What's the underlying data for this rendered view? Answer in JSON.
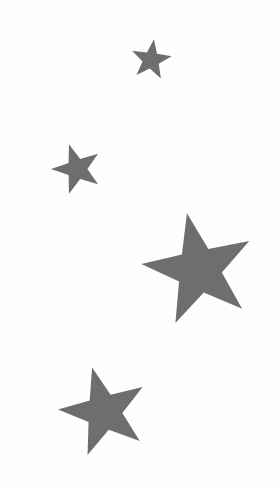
{
  "image": {
    "title": "Scattered Stars Graphic",
    "width": 279,
    "height": 488,
    "background_color": "#fefefe",
    "description": "Four gray five-pointed stars of varying size scattered diagonally on a plain white background"
  },
  "palette": {
    "star_fill": "#6e6e6e",
    "background": "#fefefe"
  },
  "stars": [
    {
      "id": "star-small-top",
      "label": "Small star (top)",
      "center_x": 151,
      "center_y": 60,
      "outer_radius": 21,
      "inner_radius": 8.6,
      "rotation_deg": 8,
      "fill": "#6e6e6e",
      "points": 5
    },
    {
      "id": "star-small-upper-left",
      "label": "Small star (upper left)",
      "center_x": 77,
      "center_y": 169,
      "outer_radius": 26,
      "inner_radius": 10.4,
      "rotation_deg": -18,
      "fill": "#6e6e6e",
      "points": 5
    },
    {
      "id": "star-large-middle-right",
      "label": "Large star (middle right)",
      "center_x": 199,
      "center_y": 270,
      "outer_radius": 58,
      "inner_radius": 23,
      "rotation_deg": -12,
      "fill": "#6e6e6e",
      "points": 5
    },
    {
      "id": "star-medium-bottom-left",
      "label": "Medium star (bottom left)",
      "center_x": 104,
      "center_y": 412,
      "outer_radius": 46,
      "inner_radius": 18.4,
      "rotation_deg": -15,
      "fill": "#6e6e6e",
      "points": 5
    }
  ]
}
